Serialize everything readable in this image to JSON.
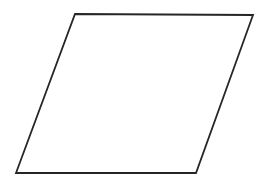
{
  "canvas": {
    "width": "266",
    "height": "189",
    "viewbox": "0 0 266 189",
    "background": "#ffffff"
  },
  "shape": {
    "kind": "parallelogram",
    "points": "75,14 253,15 196,173 16,173",
    "stroke": "#262626",
    "stroke_width": "1.8",
    "stroke_linejoin": "miter",
    "fill": "none"
  }
}
